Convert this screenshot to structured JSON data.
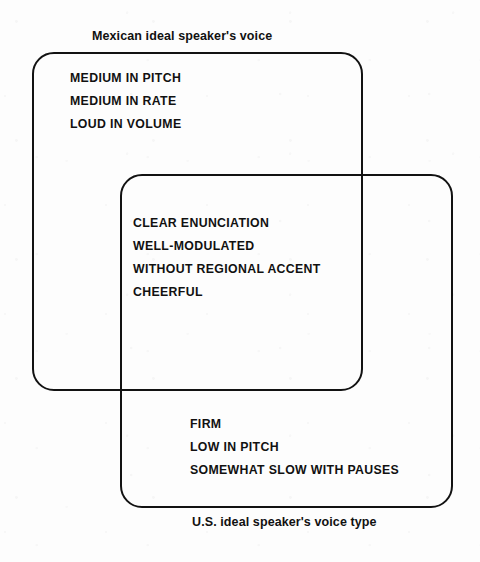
{
  "figure": {
    "type": "venn-diagram",
    "set_count": 2,
    "line_color": "#121212",
    "text_color": "#111111",
    "background_color": "#ffffff"
  },
  "sets": {
    "mexican": {
      "caption": "Mexican ideal speaker's voice",
      "caption_position": "above-left",
      "exclusive_traits": [
        "MEDIUM IN PITCH",
        "MEDIUM IN RATE",
        "LOUD IN VOLUME"
      ]
    },
    "us": {
      "caption": "U.S. ideal speaker's voice type",
      "caption_position": "below-center",
      "exclusive_traits": [
        "FIRM",
        "LOW IN PITCH",
        "SOMEWHAT SLOW WITH PAUSES"
      ]
    }
  },
  "intersection": {
    "shared_traits": [
      "CLEAR ENUNCIATION",
      "WELL-MODULATED",
      "WITHOUT REGIONAL ACCENT",
      "CHEERFUL"
    ]
  }
}
